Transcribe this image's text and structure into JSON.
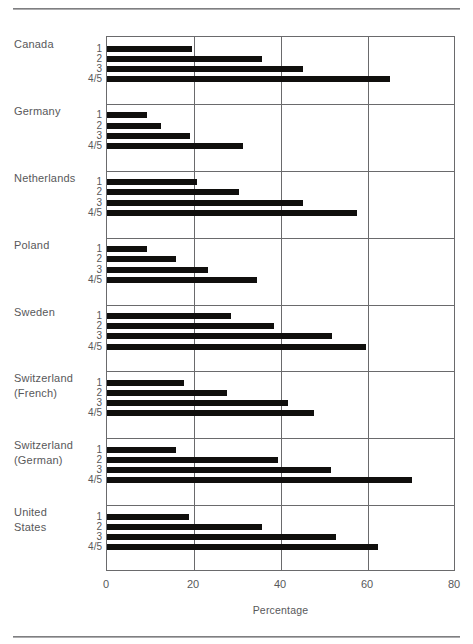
{
  "figure": {
    "xaxis_title": "Percentage",
    "x_ticks": [
      "0",
      "20",
      "40",
      "60",
      "80"
    ],
    "category_labels": [
      "1",
      "2",
      "3",
      "4/5"
    ]
  },
  "chart_data": {
    "type": "bar",
    "orientation": "horizontal",
    "title": "",
    "xlabel": "Percentage",
    "ylabel": "",
    "xlim": [
      0,
      80
    ],
    "xticks": [
      0,
      20,
      40,
      60,
      80
    ],
    "grid": true,
    "legend": "none",
    "group_label_lines": {
      "Canada": [
        "Canada"
      ],
      "Germany": [
        "Germany"
      ],
      "Netherlands": [
        "Netherlands"
      ],
      "Poland": [
        "Poland"
      ],
      "Sweden": [
        "Sweden"
      ],
      "Switzerland (French)": [
        "Switzerland",
        "(French)"
      ],
      "Switzerland (German)": [
        "Switzerland",
        "(German)"
      ],
      "United States": [
        "United",
        "States"
      ]
    },
    "categories": [
      "1",
      "2",
      "3",
      "4/5"
    ],
    "groups": [
      {
        "name": "Canada",
        "values": [
          19.6,
          35.6,
          45.0,
          65.0
        ]
      },
      {
        "name": "Germany",
        "values": [
          9.2,
          12.4,
          19.0,
          31.2
        ]
      },
      {
        "name": "Netherlands",
        "values": [
          20.6,
          30.4,
          45.0,
          57.5
        ]
      },
      {
        "name": "Poland",
        "values": [
          9.2,
          15.8,
          23.2,
          34.4
        ]
      },
      {
        "name": "Sweden",
        "values": [
          28.6,
          38.4,
          51.8,
          59.5
        ]
      },
      {
        "name": "Switzerland (French)",
        "values": [
          17.6,
          27.6,
          41.6,
          47.6
        ]
      },
      {
        "name": "Switzerland (German)",
        "values": [
          15.8,
          39.4,
          51.6,
          70.2
        ]
      },
      {
        "name": "United States",
        "values": [
          18.8,
          35.6,
          52.6,
          62.4
        ]
      }
    ]
  }
}
